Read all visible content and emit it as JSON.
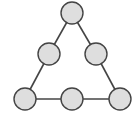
{
  "diagram": {
    "type": "triangle-node-graph",
    "colors": {
      "node_fill": "#dedede",
      "node_stroke": "#444444",
      "edge": "#444444",
      "background": "#ffffff"
    },
    "node_radius": 11,
    "nodes": [
      {
        "id": "top",
        "x": 72,
        "y": 13
      },
      {
        "id": "mid-left",
        "x": 49,
        "y": 54
      },
      {
        "id": "mid-right",
        "x": 96,
        "y": 54
      },
      {
        "id": "bottom-left",
        "x": 25,
        "y": 99
      },
      {
        "id": "bottom-middle",
        "x": 72,
        "y": 99
      },
      {
        "id": "bottom-right",
        "x": 120,
        "y": 99
      }
    ],
    "edges": [
      [
        "top",
        "mid-left"
      ],
      [
        "mid-left",
        "bottom-left"
      ],
      [
        "top",
        "mid-right"
      ],
      [
        "mid-right",
        "bottom-right"
      ],
      [
        "bottom-left",
        "bottom-middle"
      ],
      [
        "bottom-middle",
        "bottom-right"
      ]
    ],
    "caption": ""
  }
}
